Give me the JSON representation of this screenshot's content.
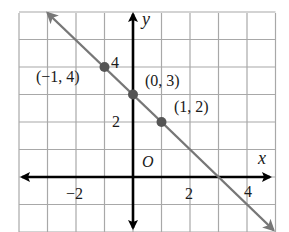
{
  "chart_data": {
    "type": "line",
    "title": "",
    "xlabel": "x",
    "ylabel": "y",
    "origin_label": "O",
    "xlim": [
      -4,
      5
    ],
    "ylim": [
      -2,
      6
    ],
    "grid": true,
    "x_tick_labels": [
      {
        "value": -2,
        "text": "−2"
      },
      {
        "value": 2,
        "text": "2"
      },
      {
        "value": 4,
        "text": "4"
      }
    ],
    "y_tick_labels": [
      {
        "value": 2,
        "text": "2"
      },
      {
        "value": 4,
        "text": "4"
      }
    ],
    "series": [
      {
        "name": "line",
        "equation": "y = -x + 3",
        "slope": -1,
        "intercept": 3,
        "x": [
          -3,
          5
        ],
        "y": [
          6,
          -2
        ],
        "arrows_both_ends": true,
        "color": "#777777"
      }
    ],
    "points": [
      {
        "x": -1,
        "y": 4,
        "label": "(−1, 4)"
      },
      {
        "x": 0,
        "y": 3,
        "label": "(0, 3)"
      },
      {
        "x": 1,
        "y": 2,
        "label": "(1, 2)"
      }
    ],
    "colors": {
      "grid": "#a8a8a8",
      "axes": "#000000",
      "line": "#777777",
      "points": "#555555",
      "text": "#1a1a1a"
    }
  }
}
